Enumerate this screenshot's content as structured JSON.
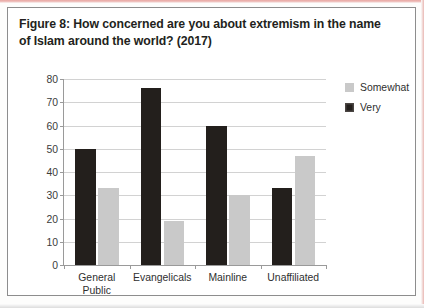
{
  "figure": {
    "title": "Figure 8: How concerned are you about extremism in the name of Islam around the world? (2017)"
  },
  "colors": {
    "very": "#231f1c",
    "somewhat": "#c9c9c9",
    "axis": "#9a9a9a",
    "grid": "#d2d2d2",
    "scan_edge": "#e8a6a2"
  },
  "chart_data": {
    "type": "bar",
    "title": "Figure 8: How concerned are you about extremism in the name of Islam around the world? (2017)",
    "categories": [
      "General Public",
      "Evangelicals",
      "Mainline",
      "Unaffiliated"
    ],
    "series": [
      {
        "name": "Very",
        "values": [
          50,
          76,
          60,
          33
        ]
      },
      {
        "name": "Somewhat",
        "values": [
          33,
          19,
          30,
          47
        ]
      }
    ],
    "series_order_in_plot": [
      "Very",
      "Somewhat"
    ],
    "legend_order": [
      "Somewhat",
      "Very"
    ],
    "xlabel": "",
    "ylabel": "",
    "ylim": [
      0,
      80
    ],
    "yticks": [
      0,
      10,
      20,
      30,
      40,
      50,
      60,
      70,
      80
    ],
    "ytick_labels": [
      "0",
      "10",
      "20",
      "30",
      "40",
      "50",
      "60",
      "70",
      "80"
    ],
    "grid": "horizontal",
    "legend_position": "right"
  }
}
